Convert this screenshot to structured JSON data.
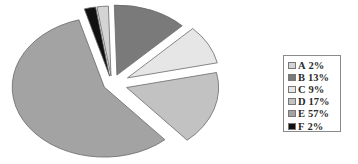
{
  "chart_data": {
    "type": "pie",
    "title": "",
    "exploded": true,
    "perspective": true,
    "categories": [
      "A",
      "B",
      "C",
      "D",
      "E",
      "F"
    ],
    "values": [
      2,
      13,
      9,
      17,
      57,
      2
    ],
    "unit": "%",
    "colors": [
      "#d4d4d4",
      "#7a7a7a",
      "#e6e6e6",
      "#c2c2c2",
      "#a3a3a3",
      "#111111"
    ],
    "legend": {
      "position": "right",
      "entries": [
        {
          "key": "A",
          "label": "2%",
          "color": "#d4d4d4"
        },
        {
          "key": "B",
          "label": "13%",
          "color": "#7a7a7a"
        },
        {
          "key": "C",
          "label": "9%",
          "color": "#e6e6e6"
        },
        {
          "key": "D",
          "label": "17%",
          "color": "#c2c2c2"
        },
        {
          "key": "E",
          "label": "57%",
          "color": "#a3a3a3"
        },
        {
          "key": "F",
          "label": "2%",
          "color": "#111111"
        }
      ]
    }
  }
}
